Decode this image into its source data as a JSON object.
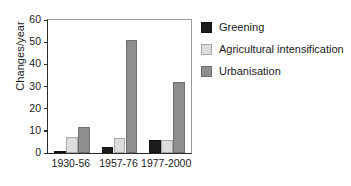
{
  "chart_data": {
    "type": "bar",
    "title": "",
    "xlabel": "",
    "ylabel": "Changes/year",
    "ylim": [
      0,
      60
    ],
    "yticks": [
      0,
      10,
      20,
      30,
      40,
      50,
      60
    ],
    "ytick_labels": [
      "0",
      "10",
      "20",
      "30",
      "40",
      "50",
      "60"
    ],
    "grid": false,
    "legend_position": "right",
    "categories": [
      "1930-56",
      "1957-76",
      "1977-2000"
    ],
    "series": [
      {
        "name": "Greening",
        "color": "#1c1c1c",
        "values": [
          1,
          2.5,
          6
        ]
      },
      {
        "name": "Agricultural intensification",
        "color": "#dcdcdc",
        "values": [
          7,
          6.8,
          6
        ]
      },
      {
        "name": "Urbanisation",
        "color": "#8e8e8e",
        "values": [
          11.8,
          51,
          32.2
        ]
      }
    ]
  },
  "legend": {
    "items": [
      {
        "label": "Greening"
      },
      {
        "label": "Agricultural intensification"
      },
      {
        "label": "Urbanisation"
      }
    ]
  }
}
